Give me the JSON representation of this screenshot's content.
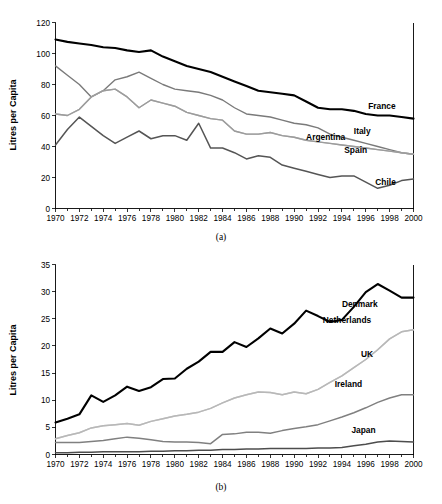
{
  "figure": {
    "panels": [
      {
        "id": "a",
        "caption": "(a)",
        "ylabel": "Litres per Capita"
      },
      {
        "id": "b",
        "caption": "(b)",
        "ylabel": "Litres per Capita"
      }
    ]
  },
  "chart_data": [
    {
      "type": "line",
      "title": "",
      "subtitle": "(a)",
      "xlabel": "",
      "ylabel": "Litres per Capita",
      "xlim": [
        1970,
        2000
      ],
      "ylim": [
        0,
        120
      ],
      "yticks": [
        0,
        20,
        40,
        60,
        80,
        100,
        120
      ],
      "xticks": [
        1970,
        1972,
        1974,
        1976,
        1978,
        1980,
        1982,
        1984,
        1986,
        1988,
        1990,
        1992,
        1994,
        1996,
        1998,
        2000
      ],
      "xtick_labels": [
        "1970",
        "1972",
        "1974",
        "1976",
        "1978",
        "1980",
        "1982",
        "1984",
        "1986",
        "1988",
        "1990",
        "1992",
        "1994",
        "1996",
        "1998",
        "2000"
      ],
      "ytick_labels": [
        "0",
        "20",
        "40",
        "60",
        "80",
        "100",
        "120"
      ],
      "grid": false,
      "legend_position": "right-inline",
      "x": [
        1970,
        1971,
        1972,
        1973,
        1974,
        1975,
        1976,
        1977,
        1978,
        1979,
        1980,
        1981,
        1982,
        1983,
        1984,
        1985,
        1986,
        1987,
        1988,
        1989,
        1990,
        1991,
        1992,
        1993,
        1994,
        1995,
        1996,
        1997,
        1998,
        1999,
        2000
      ],
      "series": [
        {
          "name": "France",
          "color": "#000000",
          "width": 2.1,
          "label_x": 1996.2,
          "label_y": 64,
          "values": [
            109,
            107.5,
            106.5,
            105.5,
            104,
            103.5,
            102,
            101,
            102,
            98,
            95,
            92,
            90,
            88,
            85,
            82,
            79,
            76,
            75,
            74,
            73,
            69,
            65,
            64,
            64,
            63,
            61,
            60,
            60,
            59,
            58
          ]
        },
        {
          "name": "Italy",
          "color": "#7a7a7a",
          "width": 1.4,
          "label_x": 1995.0,
          "label_y": 48,
          "values": [
            92,
            86,
            80,
            72,
            76,
            83,
            85,
            88,
            84,
            80,
            77,
            76,
            75,
            73,
            70,
            65,
            61,
            60,
            59,
            57,
            55,
            54,
            52,
            48,
            46,
            44,
            42,
            40,
            38,
            36,
            35
          ]
        },
        {
          "name": "Argentina",
          "color": "#b3b3b3",
          "width": 1.4,
          "label_x": 1991.0,
          "label_y": 44,
          "values": [
            61,
            60,
            64,
            72,
            76,
            77,
            72,
            65,
            70,
            68,
            66,
            62,
            60,
            58,
            57,
            50,
            48,
            48,
            49,
            47,
            46,
            44,
            43,
            42,
            41,
            40,
            39,
            38,
            37,
            36,
            35
          ]
        },
        {
          "name": "Spain",
          "color": "#9c9c9c",
          "width": 1.4,
          "label_x": 1994.2,
          "label_y": 36,
          "values": [
            61,
            60,
            64,
            72,
            76,
            77,
            72,
            65,
            70,
            68,
            66,
            62,
            60,
            58,
            57,
            50,
            48,
            48,
            49,
            47,
            46,
            44,
            43,
            42,
            41,
            40,
            39,
            38,
            37,
            36,
            35
          ]
        },
        {
          "name": "Chile",
          "color": "#555555",
          "width": 1.5,
          "label_x": 1996.8,
          "label_y": 15,
          "values": [
            41,
            51,
            59,
            53,
            47,
            42,
            46,
            50,
            45,
            47,
            47,
            44,
            55,
            39,
            39,
            36,
            32,
            34,
            33,
            28,
            26,
            24,
            22,
            20,
            21,
            21,
            17,
            13,
            15,
            18,
            19
          ]
        }
      ]
    },
    {
      "type": "line",
      "title": "",
      "subtitle": "(b)",
      "xlabel": "",
      "ylabel": "Litres per Capita",
      "xlim": [
        1970,
        2000
      ],
      "ylim": [
        0,
        35
      ],
      "yticks": [
        0,
        5,
        10,
        15,
        20,
        25,
        30,
        35
      ],
      "xticks": [
        1970,
        1972,
        1974,
        1976,
        1978,
        1980,
        1982,
        1984,
        1986,
        1988,
        1990,
        1992,
        1994,
        1996,
        1998,
        2000
      ],
      "xtick_labels": [
        "1970",
        "1972",
        "1974",
        "1976",
        "1978",
        "1980",
        "1982",
        "1984",
        "1986",
        "1988",
        "1990",
        "1992",
        "1994",
        "1996",
        "1998",
        "2000"
      ],
      "ytick_labels": [
        "0",
        "5",
        "10",
        "15",
        "20",
        "25",
        "30",
        "35"
      ],
      "grid": false,
      "legend_position": "right-inline",
      "x": [
        1970,
        1971,
        1972,
        1973,
        1974,
        1975,
        1976,
        1977,
        1978,
        1979,
        1980,
        1981,
        1982,
        1983,
        1984,
        1985,
        1986,
        1987,
        1988,
        1989,
        1990,
        1991,
        1992,
        1993,
        1994,
        1995,
        1996,
        1997,
        1998,
        1999,
        2000
      ],
      "series": [
        {
          "name": "Denmark",
          "color": "#000000",
          "width": 2.1,
          "label_x": 1994.0,
          "label_y": 27.2,
          "values": [
            5.9,
            6.6,
            7.4,
            10.9,
            9.7,
            10.9,
            12.5,
            11.7,
            12.4,
            13.9,
            14.0,
            15.8,
            17.1,
            18.9,
            18.9,
            20.7,
            19.8,
            21.4,
            23.2,
            22.3,
            24.1,
            26.5,
            25.5,
            24.4,
            24.8,
            27.2,
            29.9,
            31.4,
            30.2,
            28.9,
            28.9
          ]
        },
        {
          "name": "Netherlands",
          "color": "#cccccc",
          "width": 1.5,
          "label_x": 1992.4,
          "label_y": 24.3,
          "values": [
            2.9,
            3.5,
            4.0,
            4.9,
            5.3,
            5.5,
            5.7,
            5.4,
            6.1,
            6.6,
            7.1,
            7.4,
            7.8,
            8.5,
            9.5,
            10.4,
            11.0,
            11.5,
            11.4,
            11.0,
            11.5,
            11.2,
            12.0,
            13.3,
            14.5,
            16.0,
            17.5,
            19.3,
            21.3,
            22.6,
            23.0
          ]
        },
        {
          "name": "UK",
          "color": "#b8b8b8",
          "width": 1.5,
          "label_x": 1995.6,
          "label_y": 17.9,
          "values": [
            2.9,
            3.5,
            4.0,
            4.9,
            5.3,
            5.5,
            5.7,
            5.4,
            6.1,
            6.6,
            7.1,
            7.4,
            7.8,
            8.5,
            9.5,
            10.4,
            11.0,
            11.5,
            11.4,
            11.0,
            11.5,
            11.2,
            12.0,
            13.3,
            14.5,
            16.0,
            17.5,
            19.3,
            21.3,
            22.6,
            23.0
          ]
        },
        {
          "name": "Ireland",
          "color": "#808080",
          "width": 1.5,
          "label_x": 1993.4,
          "label_y": 12.4,
          "values": [
            2.2,
            2.2,
            2.2,
            2.4,
            2.6,
            2.9,
            3.2,
            3.0,
            2.7,
            2.4,
            2.3,
            2.3,
            2.2,
            2.0,
            3.7,
            3.8,
            4.1,
            4.1,
            3.9,
            4.4,
            4.8,
            5.1,
            5.5,
            6.2,
            6.9,
            7.7,
            8.6,
            9.6,
            10.4,
            11.0,
            11.0
          ]
        },
        {
          "name": "Japan",
          "color": "#4d4d4d",
          "width": 1.5,
          "label_x": 1994.8,
          "label_y": 4.0,
          "values": [
            0.3,
            0.3,
            0.4,
            0.4,
            0.5,
            0.5,
            0.5,
            0.5,
            0.6,
            0.6,
            0.7,
            0.7,
            0.8,
            0.8,
            0.9,
            0.9,
            1.0,
            1.0,
            1.1,
            1.1,
            1.1,
            1.1,
            1.2,
            1.2,
            1.3,
            1.6,
            1.9,
            2.3,
            2.5,
            2.4,
            2.3
          ]
        }
      ]
    }
  ]
}
